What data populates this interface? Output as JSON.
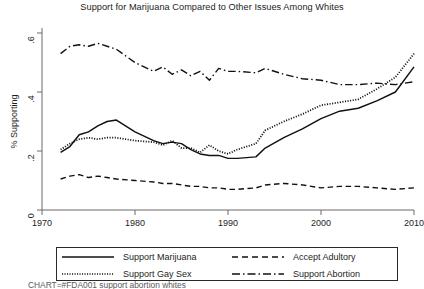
{
  "chart_data": {
    "type": "line",
    "title": "Support for Marijuana Compared to Other Issues Among Whites",
    "xlabel": "",
    "ylabel": "% Supporting",
    "xlim": [
      1970,
      2010
    ],
    "ylim": [
      0,
      0.6
    ],
    "xticks": [
      "1970",
      "1980",
      "1990",
      "2000",
      "2010"
    ],
    "xtick_values": [
      1970,
      1980,
      1990,
      2000,
      2010
    ],
    "yticks": [
      "0",
      ".2",
      ".4",
      ".6"
    ],
    "ytick_values": [
      0,
      0.2,
      0.4,
      0.6
    ],
    "grid": false,
    "legend_position": "below-plot-boxed",
    "x": [
      1972,
      1973,
      1974,
      1975,
      1976,
      1977,
      1978,
      1980,
      1982,
      1983,
      1984,
      1985,
      1986,
      1987,
      1988,
      1989,
      1990,
      1991,
      1993,
      1994,
      1996,
      1998,
      2000,
      2002,
      2004,
      2006,
      2008,
      2010
    ],
    "series": [
      {
        "name": "Support Marijuana",
        "style": "solid",
        "color": "#111111",
        "values": [
          0.195,
          0.215,
          0.255,
          0.265,
          0.285,
          0.3,
          0.305,
          0.265,
          0.235,
          0.225,
          0.23,
          0.225,
          0.205,
          0.19,
          0.185,
          0.185,
          0.175,
          0.175,
          0.18,
          0.21,
          0.245,
          0.275,
          0.31,
          0.335,
          0.345,
          0.37,
          0.4,
          0.485
        ]
      },
      {
        "name": "Support Gay Sex",
        "style": "dotted",
        "color": "#111111",
        "values": [
          0.205,
          0.225,
          0.24,
          0.245,
          0.24,
          0.245,
          0.245,
          0.235,
          0.23,
          0.22,
          0.235,
          0.21,
          0.21,
          0.195,
          0.22,
          0.2,
          0.19,
          0.205,
          0.225,
          0.27,
          0.3,
          0.325,
          0.355,
          0.365,
          0.375,
          0.41,
          0.45,
          0.53
        ]
      },
      {
        "name": "Accept Adultory",
        "style": "dashed",
        "color": "#111111",
        "values": [
          0.105,
          0.115,
          0.12,
          0.11,
          0.115,
          0.11,
          0.105,
          0.1,
          0.095,
          0.09,
          0.09,
          0.085,
          0.08,
          0.08,
          0.075,
          0.075,
          0.07,
          0.07,
          0.075,
          0.085,
          0.09,
          0.085,
          0.075,
          0.08,
          0.08,
          0.075,
          0.07,
          0.075
        ]
      },
      {
        "name": "Support Abortion",
        "style": "dashdot",
        "color": "#111111",
        "values": [
          0.53,
          0.555,
          0.56,
          0.555,
          0.565,
          0.555,
          0.545,
          0.5,
          0.47,
          0.485,
          0.46,
          0.475,
          0.455,
          0.47,
          0.44,
          0.48,
          0.47,
          0.47,
          0.465,
          0.48,
          0.46,
          0.445,
          0.44,
          0.425,
          0.425,
          0.43,
          0.425,
          0.435
        ]
      }
    ]
  },
  "legend": {
    "entries": [
      {
        "label": "Support Marijuana",
        "style": "solid"
      },
      {
        "label": "Support Gay Sex",
        "style": "dotted"
      },
      {
        "label": "Accept Adultory",
        "style": "dashed"
      },
      {
        "label": "Support Abortion",
        "style": "dashdot"
      }
    ]
  },
  "footer": {
    "note": "CHART=#FDA001 support abortion whites"
  }
}
